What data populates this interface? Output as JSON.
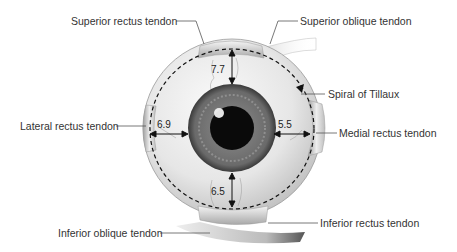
{
  "diagram": {
    "labels": {
      "superior_rectus": "Superior rectus tendon",
      "superior_oblique": "Superior oblique tendon",
      "spiral_tillaux": "Spiral of Tillaux",
      "lateral_rectus": "Lateral rectus tendon",
      "medial_rectus": "Medial rectus tendon",
      "inferior_rectus": "Inferior rectus tendon",
      "inferior_oblique": "Inferior oblique tendon"
    },
    "measurements": {
      "superior": "7.7",
      "lateral": "6.9",
      "medial": "5.5",
      "inferior": "6.5"
    },
    "colors": {
      "label_text": "#333333",
      "leader_line": "#555555",
      "sclera": "#ebebeb",
      "iris": "#6e6e6e",
      "pupil": "#0a0a0a",
      "dashed_spiral": "#111111"
    }
  }
}
